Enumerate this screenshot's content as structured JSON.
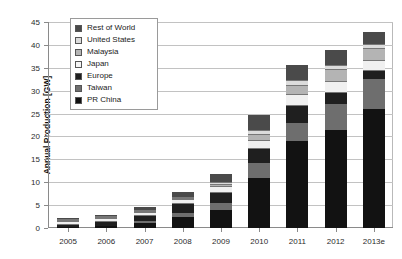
{
  "chart_data": {
    "type": "bar",
    "title": "",
    "xlabel": "",
    "ylabel": "Annual Production [GW]",
    "ylim": [
      0,
      45
    ],
    "ytick_step": 5,
    "yticks": [
      "0",
      "5",
      "10",
      "15",
      "20",
      "25",
      "30",
      "35",
      "40",
      "45"
    ],
    "grid": true,
    "stacked": true,
    "legend_position": "top-left-inside",
    "categories": [
      "2005",
      "2006",
      "2007",
      "2008",
      "2009",
      "2010",
      "2011",
      "2012",
      "2013e"
    ],
    "series": [
      {
        "name": "PR China",
        "color": "#121212",
        "values": [
          0.15,
          0.35,
          1.1,
          2.4,
          4.0,
          11.0,
          19.0,
          21.5,
          26.0
        ]
      },
      {
        "name": "Taiwan",
        "color": "#6e6e6e",
        "values": [
          0.1,
          0.2,
          0.45,
          0.85,
          1.4,
          3.2,
          4.0,
          5.5,
          6.5
        ]
      },
      {
        "name": "Europe",
        "color": "#1f1f1f",
        "values": [
          0.45,
          0.75,
          1.1,
          1.9,
          2.2,
          3.0,
          3.6,
          2.6,
          1.9
        ]
      },
      {
        "name": "Japan",
        "color": "#f0f0f0",
        "values": [
          0.8,
          0.9,
          0.95,
          1.15,
          1.5,
          2.1,
          2.6,
          2.6,
          2.4
        ]
      },
      {
        "name": "Malaysia",
        "color": "#b4b4b4",
        "values": [
          0.0,
          0.0,
          0.0,
          0.1,
          0.35,
          1.0,
          1.9,
          2.3,
          2.4
        ]
      },
      {
        "name": "United States",
        "color": "#dcdcdc",
        "values": [
          0.15,
          0.2,
          0.25,
          0.45,
          0.6,
          1.1,
          1.3,
          1.2,
          1.1
        ]
      },
      {
        "name": "Rest of World",
        "color": "#4a4a4a",
        "values": [
          0.25,
          0.3,
          0.55,
          0.95,
          1.75,
          3.3,
          3.2,
          3.3,
          2.6
        ]
      }
    ],
    "totals": [
      1.9,
      2.7,
      4.4,
      7.8,
      11.8,
      24.7,
      35.6,
      39.0,
      42.9
    ]
  },
  "legend": {
    "items": [
      {
        "label": "Rest of World",
        "color": "#4a4a4a"
      },
      {
        "label": "United States",
        "color": "#dcdcdc"
      },
      {
        "label": "Malaysia",
        "color": "#b4b4b4"
      },
      {
        "label": "Japan",
        "color": "#f5f5f5"
      },
      {
        "label": "Europe",
        "color": "#1f1f1f"
      },
      {
        "label": "Taiwan",
        "color": "#6e6e6e"
      },
      {
        "label": "PR China",
        "color": "#121212"
      }
    ]
  }
}
